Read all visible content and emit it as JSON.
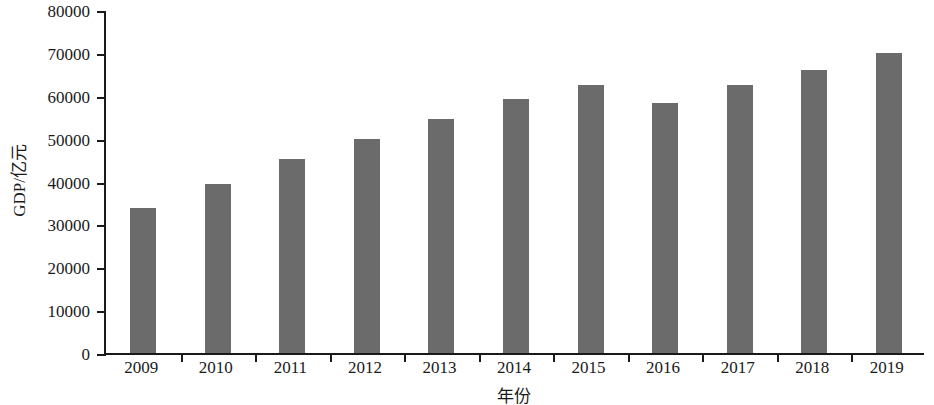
{
  "chart_data": {
    "type": "bar",
    "title": "",
    "xlabel": "年份",
    "ylabel": "GDP/亿元",
    "categories": [
      "2009",
      "2010",
      "2011",
      "2012",
      "2013",
      "2014",
      "2015",
      "2016",
      "2017",
      "2018",
      "2019"
    ],
    "values": [
      33900,
      39400,
      45300,
      49900,
      54500,
      59200,
      62600,
      58300,
      62500,
      66000,
      70000
    ],
    "ylim": [
      0,
      80000
    ],
    "ytick_labels": [
      "0",
      "10000",
      "20000",
      "30000",
      "40000",
      "50000",
      "60000",
      "70000",
      "80000"
    ],
    "ytick_values": [
      0,
      10000,
      20000,
      30000,
      40000,
      50000,
      60000,
      70000,
      80000
    ],
    "grid": false,
    "legend": false,
    "bar_color": "#6b6b6b",
    "axis_color": "#1a1a1a",
    "background_color": "#ffffff"
  }
}
